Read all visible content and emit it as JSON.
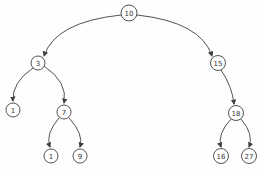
{
  "diagram": {
    "type": "binary-tree",
    "stroke_color": "#3f3f3f",
    "node_fill": "#ffffff",
    "text_color": "#333333",
    "nodes": [
      {
        "id": "10",
        "label": "10",
        "x": 129,
        "y": 13,
        "r": 8
      },
      {
        "id": "3",
        "label": "3",
        "x": 38,
        "y": 63,
        "r": 7
      },
      {
        "id": "15",
        "label": "15",
        "x": 218,
        "y": 63,
        "r": 7.5
      },
      {
        "id": "1-left",
        "label": "1",
        "x": 13,
        "y": 110,
        "r": 7
      },
      {
        "id": "7",
        "label": "7",
        "x": 64,
        "y": 112,
        "r": 7
      },
      {
        "id": "18",
        "label": "18",
        "x": 236,
        "y": 113,
        "r": 7.5
      },
      {
        "id": "1-mid",
        "label": "1",
        "x": 51,
        "y": 156,
        "r": 7
      },
      {
        "id": "9",
        "label": "9",
        "x": 80,
        "y": 156,
        "r": 7
      },
      {
        "id": "16",
        "label": "16",
        "x": 221,
        "y": 156,
        "r": 7.5
      },
      {
        "id": "27",
        "label": "27",
        "x": 249,
        "y": 156,
        "r": 7.5
      }
    ],
    "edges": [
      {
        "from": "10",
        "to": "3",
        "sx": 121,
        "sy": 15,
        "cx": 55,
        "cy": 22,
        "ex": 44,
        "ey": 56
      },
      {
        "from": "10",
        "to": "15",
        "sx": 137,
        "sy": 15,
        "cx": 201,
        "cy": 22,
        "ex": 212,
        "ey": 56
      },
      {
        "from": "3",
        "to": "1-left",
        "sx": 33,
        "sy": 68,
        "cx": 12,
        "cy": 82,
        "ex": 13,
        "ey": 101
      },
      {
        "from": "3",
        "to": "7",
        "sx": 44,
        "sy": 66,
        "cx": 68,
        "cy": 82,
        "ex": 64,
        "ey": 103
      },
      {
        "from": "7",
        "to": "1-mid",
        "sx": 59,
        "sy": 118,
        "cx": 45,
        "cy": 134,
        "ex": 50,
        "ey": 147
      },
      {
        "from": "7",
        "to": "9",
        "sx": 69,
        "sy": 118,
        "cx": 84,
        "cy": 134,
        "ex": 80,
        "ey": 147
      },
      {
        "from": "15",
        "to": "18",
        "sx": 221,
        "sy": 70,
        "cx": 232,
        "cy": 86,
        "ex": 234,
        "ey": 104
      },
      {
        "from": "18",
        "to": "16",
        "sx": 231,
        "sy": 119,
        "cx": 217,
        "cy": 134,
        "ex": 221,
        "ey": 147
      },
      {
        "from": "18",
        "to": "27",
        "sx": 241,
        "sy": 119,
        "cx": 254,
        "cy": 134,
        "ex": 249,
        "ey": 147
      }
    ]
  }
}
